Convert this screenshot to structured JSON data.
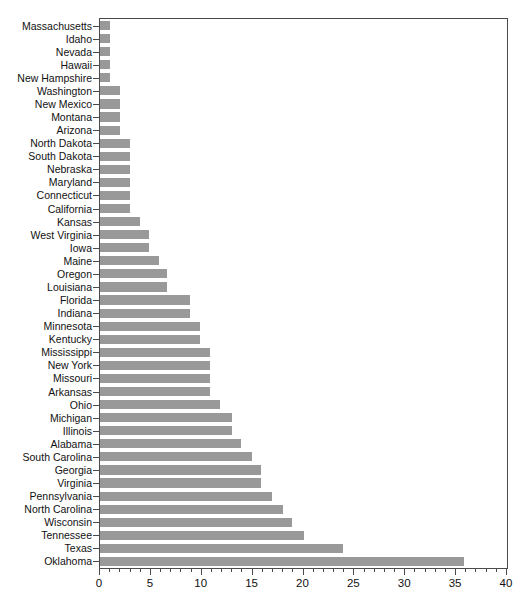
{
  "chart_data": {
    "type": "bar",
    "orientation": "horizontal",
    "title": "",
    "subtitle": "",
    "xlabel": "",
    "ylabel": "",
    "xlim": [
      0,
      40
    ],
    "ylim": null,
    "grid": false,
    "legend": null,
    "bar_color": "#999999",
    "axis_color": "#4a4a4a",
    "xticks": [
      0,
      5,
      10,
      15,
      20,
      25,
      30,
      35,
      40
    ],
    "xtick_labels": [
      "0",
      "5",
      "10",
      "15",
      "20",
      "25",
      "30",
      "35",
      "40"
    ],
    "xtick_minor_step": 1,
    "categories": [
      "Massachusetts",
      "Idaho",
      "Nevada",
      "Hawaii",
      "New Hampshire",
      "Washington",
      "New Mexico",
      "Montana",
      "Arizona",
      "North Dakota",
      "South Dakota",
      "Nebraska",
      "Maryland",
      "Connecticut",
      "California",
      "Kansas",
      "West Virginia",
      "Iowa",
      "Maine",
      "Oregon",
      "Louisiana",
      "Florida",
      "Indiana",
      "Minnesota",
      "Kentucky",
      "Mississippi",
      "New York",
      "Missouri",
      "Arkansas",
      "Ohio",
      "Michigan",
      "Illinois",
      "Alabama",
      "South Carolina",
      "Georgia",
      "Virginia",
      "Pennsylvania",
      "North Carolina",
      "Wisconsin",
      "Tennessee",
      "Texas",
      "Oklahoma"
    ],
    "values": [
      1.0,
      1.0,
      1.0,
      1.0,
      1.0,
      2.0,
      2.0,
      2.0,
      2.0,
      2.9,
      2.9,
      2.9,
      2.9,
      2.9,
      2.9,
      3.9,
      4.8,
      4.8,
      5.8,
      6.6,
      6.6,
      8.8,
      8.8,
      9.8,
      9.8,
      10.8,
      10.8,
      10.8,
      10.8,
      11.8,
      13.0,
      13.0,
      13.9,
      14.9,
      15.8,
      15.8,
      16.9,
      18.0,
      18.9,
      20.0,
      23.9,
      35.8
    ]
  }
}
